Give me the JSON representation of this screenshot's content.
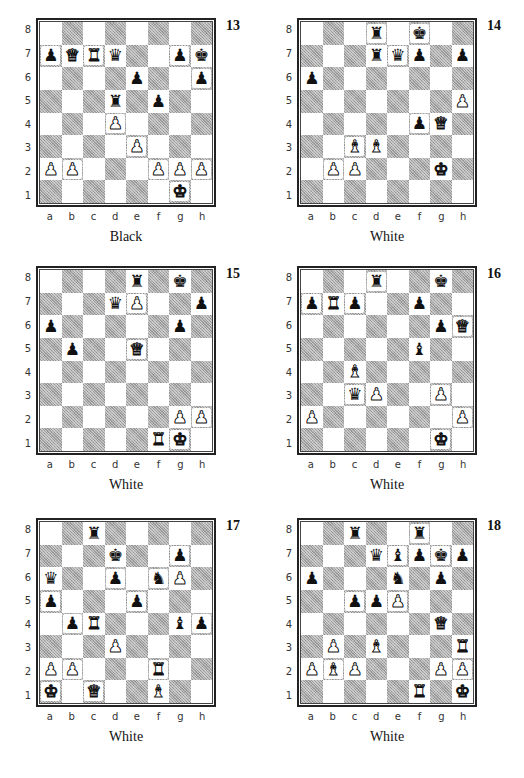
{
  "page": {
    "files": [
      "a",
      "b",
      "c",
      "d",
      "e",
      "f",
      "g",
      "h"
    ],
    "ranks": [
      "8",
      "7",
      "6",
      "5",
      "4",
      "3",
      "2",
      "1"
    ],
    "piece_glyphs": {
      "K": "♚",
      "Q": "♛",
      "R": "♜",
      "B": "♝",
      "N": "♞",
      "P": "♟"
    }
  },
  "diagrams": [
    {
      "number": "13",
      "to_move": "Black",
      "position": {
        "left": 0,
        "top": 0
      },
      "pieces": {
        "a7": "bP",
        "b7": "wQ",
        "c7": "wR",
        "d7": "bQ",
        "g7": "bP",
        "h7": "bK",
        "e6": "bP",
        "h6": "bP",
        "d5": "bR",
        "f5": "bP",
        "d4": "wP",
        "e3": "wP",
        "a2": "wP",
        "b2": "wP",
        "f2": "wP",
        "g2": "wP",
        "h2": "wP",
        "g1": "wK"
      }
    },
    {
      "number": "14",
      "to_move": "White",
      "position": {
        "left": 261,
        "top": 0
      },
      "pieces": {
        "d8": "bR",
        "f8": "bK",
        "d7": "bR",
        "e7": "bQ",
        "f7": "bP",
        "h7": "bP",
        "a6": "bP",
        "h5": "wP",
        "f4": "bP",
        "g4": "wQ",
        "c3": "wB",
        "d3": "wB",
        "b2": "wP",
        "c2": "wP",
        "g2": "wK"
      }
    },
    {
      "number": "15",
      "to_move": "White",
      "position": {
        "left": 0,
        "top": 248
      },
      "pieces": {
        "e8": "bR",
        "g8": "bK",
        "d7": "bQ",
        "e7": "wP",
        "h7": "bP",
        "a6": "bP",
        "g6": "bP",
        "b5": "bP",
        "e5": "wQ",
        "g2": "wP",
        "h2": "wP",
        "f1": "wR",
        "g1": "wK"
      }
    },
    {
      "number": "16",
      "to_move": "White",
      "position": {
        "left": 261,
        "top": 248
      },
      "pieces": {
        "d8": "bR",
        "g8": "bK",
        "a7": "bP",
        "b7": "wR",
        "c7": "bP",
        "f7": "bP",
        "g6": "bP",
        "h6": "wQ",
        "f5": "bB",
        "c4": "wB",
        "c3": "bQ",
        "d3": "wP",
        "g3": "wP",
        "a2": "wP",
        "h2": "wP",
        "g1": "wK"
      }
    },
    {
      "number": "17",
      "to_move": "White",
      "position": {
        "left": 0,
        "top": 500
      },
      "pieces": {
        "c8": "bR",
        "d7": "bK",
        "g7": "bP",
        "a6": "bQ",
        "d6": "bP",
        "f6": "bN",
        "g6": "wP",
        "a5": "bP",
        "e5": "bP",
        "b4": "bP",
        "c4": "wR",
        "g4": "bB",
        "h4": "bP",
        "d3": "wP",
        "a2": "wP",
        "b2": "wP",
        "f2": "wR",
        "a1": "wK",
        "c1": "wQ",
        "f1": "wB"
      }
    },
    {
      "number": "18",
      "to_move": "White",
      "position": {
        "left": 261,
        "top": 500
      },
      "pieces": {
        "c8": "bR",
        "f8": "bR",
        "d7": "bQ",
        "e7": "bB",
        "f7": "bP",
        "g7": "bK",
        "h7": "bP",
        "a6": "bP",
        "e6": "bN",
        "g6": "bP",
        "c5": "bP",
        "d5": "bP",
        "e5": "wP",
        "g4": "wQ",
        "b3": "wP",
        "d3": "wB",
        "h3": "wR",
        "a2": "wP",
        "b2": "wB",
        "c2": "wP",
        "g2": "wP",
        "h2": "wP",
        "f1": "wR",
        "h1": "wK"
      }
    }
  ]
}
